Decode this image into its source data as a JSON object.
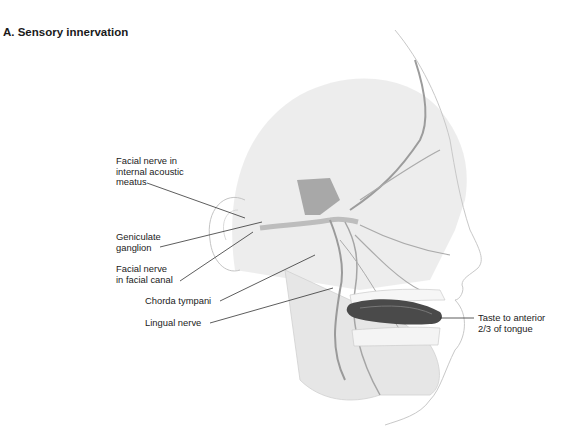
{
  "figure": {
    "title": "A. Sensory innervation",
    "labels": [
      {
        "id": "facial-nerve-internal-acoustic-meatus",
        "text": "Facial nerve in\ninternal acoustic\nmeatus"
      },
      {
        "id": "geniculate-ganglion",
        "text": "Geniculate\nganglion"
      },
      {
        "id": "facial-nerve-facial-canal",
        "text": "Facial nerve\nin facial canal"
      },
      {
        "id": "chorda-tympani",
        "text": "Chorda tympani"
      },
      {
        "id": "lingual-nerve",
        "text": "Lingual nerve"
      },
      {
        "id": "taste-anterior-tongue",
        "text": "Taste to anterior\n2/3 of tongue"
      }
    ],
    "colors": {
      "skull": "#ececec",
      "nerve": "#9a9a9a",
      "outline": "#c8c8c8",
      "tongue": "#4a4a4a",
      "leader": "#333333"
    }
  }
}
